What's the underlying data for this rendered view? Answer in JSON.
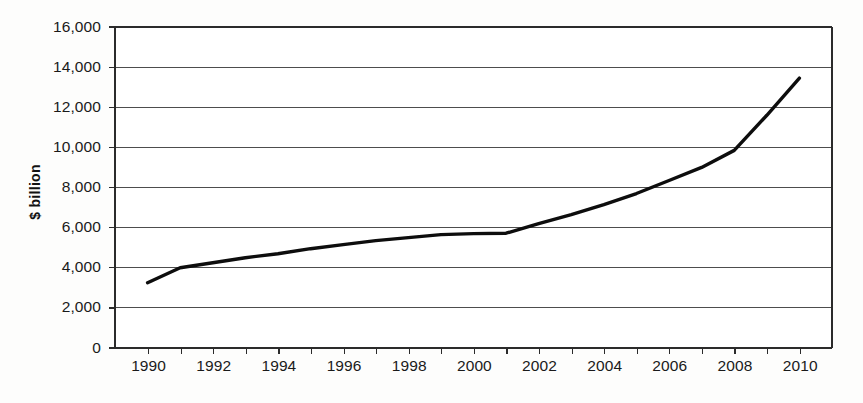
{
  "chart_data": {
    "type": "line",
    "title": "",
    "subtitle": "",
    "xlabel": "",
    "ylabel": "$ billion",
    "xlim": [
      1989,
      2011
    ],
    "ylim": [
      0,
      16000
    ],
    "grid": true,
    "legend": "none",
    "x_tick_labels": [
      "1990",
      "1992",
      "1994",
      "1996",
      "1998",
      "2000",
      "2002",
      "2004",
      "2006",
      "2008",
      "2010"
    ],
    "x_tick_values": [
      1990,
      1992,
      1994,
      1996,
      1998,
      2000,
      2002,
      2004,
      2006,
      2008,
      2010
    ],
    "y_tick_labels": [
      "0",
      "2,000",
      "4,000",
      "6,000",
      "8,000",
      "10,000",
      "12,000",
      "14,000",
      "16,000"
    ],
    "y_tick_values": [
      0,
      2000,
      4000,
      6000,
      8000,
      10000,
      12000,
      14000,
      16000
    ],
    "x": [
      1990,
      1991,
      1992,
      1993,
      1994,
      1995,
      1996,
      1997,
      1998,
      1999,
      2000,
      2001,
      2002,
      2003,
      2004,
      2005,
      2006,
      2007,
      2008,
      2009,
      2010
    ],
    "values": [
      3250,
      4000,
      4250,
      4500,
      4700,
      4950,
      5150,
      5350,
      5500,
      5650,
      5700,
      5720,
      6200,
      6650,
      7150,
      7700,
      8350,
      9000,
      9850,
      11600,
      13450
    ],
    "series": [
      {
        "name": "$ billion",
        "color": "#0d0d0d",
        "values": [
          3250,
          4000,
          4250,
          4500,
          4700,
          4950,
          5150,
          5350,
          5500,
          5650,
          5700,
          5720,
          6200,
          6650,
          7150,
          7700,
          8350,
          9000,
          9850,
          11600,
          13450
        ]
      }
    ]
  },
  "axes": {
    "y_label": "$ billion"
  }
}
